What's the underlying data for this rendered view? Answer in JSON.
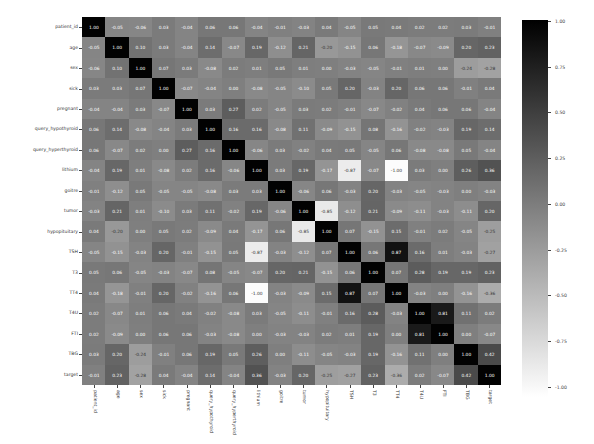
{
  "chart_data": {
    "type": "heatmap",
    "title": "",
    "xlabel": "",
    "ylabel": "",
    "labels": [
      "patient_id",
      "age",
      "sex",
      "sick",
      "pregnant",
      "query_hypothyroid",
      "query_hyperthyroid",
      "lithium",
      "goitre",
      "tumor",
      "hypopituitary",
      "TSH",
      "T3",
      "TT4",
      "T4U",
      "FTI",
      "TBG",
      "target"
    ],
    "matrix": [
      [
        1.0,
        -0.05,
        -0.06,
        0.03,
        -0.04,
        0.06,
        0.06,
        -0.04,
        -0.01,
        -0.03,
        0.04,
        -0.05,
        0.05,
        0.04,
        0.02,
        0.02,
        0.03,
        -0.01
      ],
      [
        -0.05,
        1.0,
        0.1,
        0.03,
        -0.04,
        0.14,
        -0.07,
        0.19,
        -0.12,
        0.21,
        -0.2,
        -0.15,
        0.06,
        -0.18,
        -0.07,
        -0.09,
        0.2,
        0.23
      ],
      [
        -0.06,
        0.1,
        1.0,
        0.07,
        0.03,
        -0.08,
        0.02,
        0.01,
        0.05,
        0.01,
        0.0,
        -0.03,
        -0.05,
        -0.01,
        0.01,
        0.0,
        -0.24,
        -0.28
      ],
      [
        0.03,
        0.03,
        0.07,
        1.0,
        -0.07,
        -0.04,
        0.0,
        -0.08,
        -0.05,
        -0.1,
        0.05,
        0.2,
        -0.03,
        0.2,
        0.06,
        0.06,
        -0.01,
        0.04
      ],
      [
        -0.04,
        -0.04,
        0.03,
        -0.07,
        1.0,
        0.03,
        0.27,
        0.02,
        -0.05,
        0.03,
        0.02,
        -0.01,
        -0.07,
        -0.02,
        0.04,
        0.06,
        0.06,
        -0.04
      ],
      [
        0.06,
        0.14,
        -0.08,
        -0.04,
        0.03,
        1.0,
        0.16,
        0.16,
        -0.08,
        0.11,
        -0.09,
        -0.15,
        0.08,
        -0.16,
        -0.02,
        -0.03,
        0.19,
        0.14
      ],
      [
        0.06,
        -0.07,
        0.02,
        0.0,
        0.27,
        0.16,
        1.0,
        -0.06,
        0.03,
        -0.02,
        0.04,
        0.05,
        -0.05,
        0.06,
        -0.08,
        -0.08,
        0.05,
        -0.04
      ],
      [
        -0.04,
        0.19,
        0.01,
        -0.08,
        0.02,
        0.16,
        -0.06,
        1.0,
        0.03,
        0.19,
        -0.17,
        -0.87,
        -0.07,
        -1.0,
        0.03,
        0.0,
        0.26,
        0.36
      ],
      [
        -0.01,
        -0.12,
        0.05,
        -0.05,
        -0.05,
        -0.08,
        0.03,
        0.03,
        1.0,
        -0.06,
        0.06,
        -0.03,
        0.2,
        -0.03,
        -0.05,
        -0.03,
        0.0,
        -0.03
      ],
      [
        -0.03,
        0.21,
        0.01,
        -0.1,
        0.03,
        0.11,
        -0.02,
        0.19,
        -0.06,
        1.0,
        -0.85,
        -0.12,
        0.21,
        -0.09,
        -0.11,
        -0.03,
        -0.11,
        0.2
      ],
      [
        0.04,
        -0.2,
        0.0,
        0.05,
        0.02,
        -0.09,
        0.04,
        -0.17,
        0.06,
        -0.85,
        1.0,
        0.07,
        -0.15,
        0.15,
        -0.01,
        0.02,
        -0.05,
        -0.25
      ],
      [
        -0.05,
        -0.15,
        -0.03,
        0.2,
        -0.01,
        -0.15,
        0.05,
        -0.87,
        -0.03,
        -0.12,
        0.07,
        1.0,
        0.06,
        0.87,
        0.16,
        0.01,
        -0.03,
        -0.27
      ],
      [
        0.05,
        0.06,
        -0.05,
        -0.03,
        -0.07,
        0.08,
        -0.05,
        -0.07,
        0.2,
        0.21,
        -0.15,
        0.06,
        1.0,
        0.07,
        0.28,
        0.19,
        0.19,
        0.23
      ],
      [
        0.04,
        -0.18,
        -0.01,
        0.2,
        -0.02,
        -0.16,
        0.06,
        -1.0,
        -0.03,
        -0.09,
        0.15,
        0.87,
        0.07,
        1.0,
        -0.03,
        0.0,
        -0.16,
        -0.36
      ],
      [
        0.02,
        -0.07,
        0.01,
        0.06,
        0.04,
        -0.02,
        -0.08,
        0.03,
        -0.05,
        -0.11,
        -0.01,
        0.16,
        0.28,
        -0.03,
        1.0,
        0.81,
        0.11,
        0.02
      ],
      [
        0.02,
        -0.09,
        0.0,
        0.06,
        0.06,
        -0.03,
        -0.08,
        0.0,
        -0.03,
        -0.03,
        0.02,
        0.01,
        0.19,
        0.0,
        0.81,
        1.0,
        0.0,
        -0.07
      ],
      [
        0.03,
        0.2,
        -0.24,
        -0.01,
        0.06,
        0.19,
        0.05,
        0.26,
        0.0,
        -0.11,
        -0.05,
        -0.03,
        0.19,
        -0.16,
        0.11,
        0.0,
        1.0,
        0.42
      ],
      [
        -0.01,
        0.23,
        -0.28,
        0.04,
        -0.04,
        0.14,
        -0.04,
        0.36,
        -0.03,
        0.2,
        -0.25,
        -0.27,
        0.23,
        -0.36,
        0.02,
        -0.07,
        0.42,
        1.0
      ]
    ],
    "colorbar": {
      "min": -1.0,
      "max": 1.0,
      "ticks": [
        "1.00",
        "0.75",
        "0.50",
        "0.25",
        "0.00",
        "-0.25",
        "-0.50",
        "-0.75",
        "-1.00"
      ],
      "colormap": "gray_r",
      "color_high": "#000000",
      "color_low": "#ffffff"
    },
    "annot_format": "0.2f",
    "grid": false,
    "legend_position": "right"
  }
}
